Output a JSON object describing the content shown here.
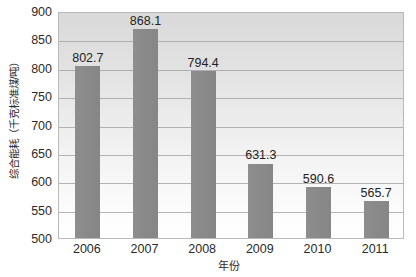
{
  "chart_data": {
    "type": "bar",
    "title": "",
    "xlabel": "年份",
    "ylabel": "综合能耗（千克标准煤/吨）",
    "categories": [
      "2006",
      "2007",
      "2008",
      "2009",
      "2010",
      "2011"
    ],
    "values": [
      802.7,
      868.1,
      794.4,
      631.3,
      590.6,
      565.7
    ],
    "value_labels": [
      "802.7",
      "868.1",
      "794.4",
      "631.3",
      "590.6",
      "565.7"
    ],
    "ylim": [
      500,
      900
    ],
    "yticks": [
      900,
      850,
      800,
      750,
      700,
      650,
      600,
      550,
      500
    ],
    "ytick_labels": [
      "900",
      "850",
      "800",
      "750",
      "700",
      "650",
      "600",
      "550",
      "500"
    ],
    "grid": true,
    "legend": null,
    "series": [
      {
        "name": "综合能耗",
        "values": [
          802.7,
          868.1,
          794.4,
          631.3,
          590.6,
          565.7
        ]
      }
    ],
    "colors": {
      "bar": "#8a8a8a",
      "gridline": "#9e9e9e",
      "plot_border": "#b9b9b9",
      "plot_bg_top": "#d9d9d9",
      "plot_bg_bottom": "#ffffff",
      "text": "#2b2b2b"
    }
  }
}
